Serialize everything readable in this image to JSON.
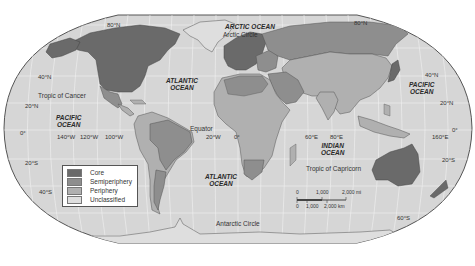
{
  "map": {
    "title": "World-system core, semiperiphery, periphery",
    "colors": {
      "ocean": "#d8d8d8",
      "core": "#6a6a6a",
      "semiperiphery": "#8e8e8e",
      "periphery": "#b0b0b0",
      "unclassified": "#dedede",
      "graticule": "#f4f4f4",
      "border": "#555555"
    },
    "oceans": {
      "arctic": "ARCTIC OCEAN",
      "atlantic_north_1": "ATLANTIC",
      "atlantic_north_2": "OCEAN",
      "atlantic_south_1": "ATLANTIC",
      "atlantic_south_2": "OCEAN",
      "pacific_west_1": "PACIFIC",
      "pacific_west_2": "OCEAN",
      "pacific_east_1": "PACIFIC",
      "pacific_east_2": "OCEAN",
      "indian_1": "INDIAN",
      "indian_2": "OCEAN"
    },
    "lines": {
      "arctic_circle": "Arctic Circle",
      "tropic_cancer": "Tropic of Cancer",
      "equator": "Equator",
      "tropic_capricorn": "Tropic of Capricorn",
      "antarctic_circle": "Antarctic Circle"
    },
    "latitudes": {
      "n80_left": "80°N",
      "n80_right": "80°N",
      "n40_left": "40°N",
      "n40_right": "40°N",
      "n20_left": "20°N",
      "n20_right": "20°N",
      "eq_left": "0°",
      "eq_right": "0°",
      "s20_left": "20°S",
      "s20_right": "20°S",
      "s40_left": "40°S",
      "s60_right": "60°S"
    },
    "longitudes": {
      "w140": "140°W",
      "w120": "120°W",
      "w100": "100°W",
      "w20": "20°W",
      "zero": "0°",
      "e60": "60°E",
      "e80": "80°E",
      "e160": "160°E"
    },
    "legend": {
      "items": [
        {
          "label": "Core",
          "color": "#6a6a6a"
        },
        {
          "label": "Semiperiphery",
          "color": "#8e8e8e"
        },
        {
          "label": "Periphery",
          "color": "#b0b0b0"
        },
        {
          "label": "Unclassified",
          "color": "#dedede"
        }
      ]
    },
    "scale_bar": {
      "mi_0": "0",
      "mi_1": "1,000",
      "mi_2": "2,000 mi",
      "km_0": "0",
      "km_1": "1,000",
      "km_2": "2,000 km"
    }
  }
}
